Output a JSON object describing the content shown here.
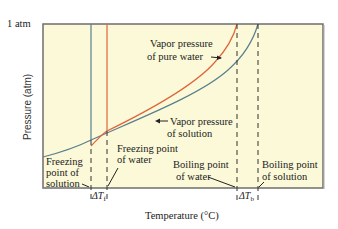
{
  "diagram": {
    "type": "phase-diagram-vapor-pressure",
    "colors": {
      "background": "#fbf9d8",
      "frame": "#6e6e6e",
      "pure_water_curve": "#e0643a",
      "solution_curve": "#5a7f8f",
      "dashed": "#333333"
    },
    "y_top_label": "1 atm",
    "y_axis_label": "Pressure (atm)",
    "x_axis_label": "Temperature (°C)",
    "labels": {
      "vapor_pressure_pure_water_line1": "Vapor pressure",
      "vapor_pressure_pure_water_line2": "of pure water",
      "vapor_pressure_solution_line1": "Vapor pressure",
      "vapor_pressure_solution_line2": "of solution",
      "freezing_point_solution_line1": "Freezing",
      "freezing_point_solution_line2": "point of",
      "freezing_point_solution_line3": "solution",
      "freezing_point_water_line1": "Freezing point",
      "freezing_point_water_line2": "of water",
      "boiling_point_water_line1": "Boiling point",
      "boiling_point_water_line2": "of water",
      "boiling_point_solution_line1": "Boiling point",
      "boiling_point_solution_line2": "of solution",
      "delta_tf_symbol": "ΔT",
      "delta_tf_sub": "f",
      "delta_tb_symbol": "ΔT",
      "delta_tb_sub": "b"
    },
    "curves": [
      {
        "name": "Vapor pressure of pure water",
        "color": "#e0643a"
      },
      {
        "name": "Vapor pressure of solution",
        "color": "#5a7f8f"
      },
      {
        "name": "Solid-liquid line (pure water)",
        "color": "#e0643a"
      },
      {
        "name": "Solid-liquid line (solution)",
        "color": "#5a7f8f"
      }
    ]
  }
}
